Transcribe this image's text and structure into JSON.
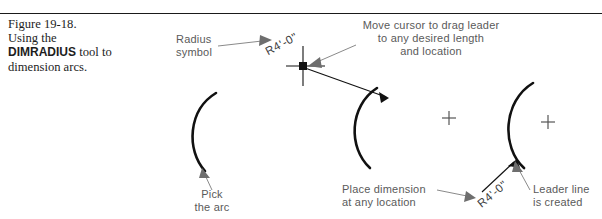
{
  "figure": {
    "number": "Figure 19-18.",
    "caption_line1": "Using the",
    "caption_bold": "DIMRADIUS",
    "caption_line2_tail": " tool to",
    "caption_line3": "dimension arcs."
  },
  "annotations": {
    "radius_symbol_l1": "Radius",
    "radius_symbol_l2": "symbol",
    "move_cursor_l1": "Move cursor to drag leader",
    "move_cursor_l2": "to any desired length",
    "move_cursor_l3": "and location",
    "pick_arc_l1": "Pick",
    "pick_arc_l2": "the arc",
    "place_dimension_l1": "Place dimension",
    "place_dimension_l2": "at any location",
    "leader_line_l1": "Leader line",
    "leader_line_l2": "is created"
  },
  "dimensions": {
    "radius_value_top": "R4'-0\"",
    "radius_value_bottom": "R4'-0\""
  },
  "colors": {
    "ink": "#111111",
    "annotation_text": "#5a5a5a",
    "rule": "#1a1a1a",
    "center_mark": "#555555"
  },
  "panels": [
    {
      "name": "panel-pick-arc",
      "center_mark": false
    },
    {
      "name": "panel-drag-leader",
      "center_mark": true
    },
    {
      "name": "panel-leader-created",
      "center_mark": true
    }
  ]
}
